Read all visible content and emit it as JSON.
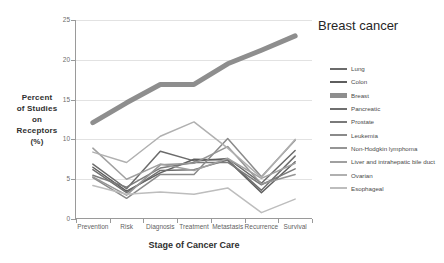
{
  "chart_data": {
    "type": "line",
    "title": "",
    "xlabel": "Stage of Cancer Care",
    "ylabel": "Percent of Studies on Receptors (%)",
    "ylabel_lines": [
      "Percent",
      "of Studies",
      "on",
      "Receptors",
      "(%)"
    ],
    "categories": [
      "Prevention",
      "Risk",
      "Diagnosis",
      "Treatment",
      "Metastasis",
      "Recurrence",
      "Survival"
    ],
    "ylim": [
      0,
      25
    ],
    "yticks": [
      0,
      5,
      10,
      15,
      20,
      25
    ],
    "grid": "horizontal",
    "legend_position": "right",
    "annotations": [
      {
        "text": "Breast cancer",
        "series": "Breast",
        "x": "Survival"
      }
    ],
    "series": [
      {
        "name": "Lung",
        "color": "#6b6b6b",
        "width": 1.5,
        "values": [
          6.9,
          3.8,
          8.5,
          7.3,
          7.6,
          4.5,
          8.6
        ]
      },
      {
        "name": "Colon",
        "color": "#5e5e5e",
        "width": 1.5,
        "values": [
          6.5,
          3.5,
          5.8,
          7.5,
          7.4,
          3.3,
          7.2
        ]
      },
      {
        "name": "Breast",
        "color": "#8e8e8e",
        "width": 5.0,
        "values": [
          12.1,
          14.6,
          16.9,
          16.9,
          19.5,
          21.2,
          23.0
        ]
      },
      {
        "name": "Pancreatic",
        "color": "#6f6f6f",
        "width": 1.5,
        "values": [
          6.2,
          3.3,
          6.1,
          6.2,
          7.4,
          3.6,
          7.9
        ]
      },
      {
        "name": "Prostate",
        "color": "#7a7a7a",
        "width": 1.5,
        "values": [
          5.5,
          4.0,
          6.4,
          7.1,
          7.1,
          4.3,
          6.3
        ]
      },
      {
        "name": "Leukemia",
        "color": "#8a8a8a",
        "width": 1.5,
        "values": [
          5.2,
          2.6,
          5.6,
          5.6,
          10.1,
          5.3,
          9.9
        ]
      },
      {
        "name": "Non-Hodgkin lymphoma",
        "color": "#959595",
        "width": 1.5,
        "values": [
          5.3,
          3.0,
          6.8,
          7.0,
          9.1,
          4.4,
          5.6
        ]
      },
      {
        "name": "Liver and intrahepatic bile duct",
        "color": "#a0a0a0",
        "width": 1.5,
        "values": [
          8.9,
          5.0,
          6.9,
          6.1,
          7.6,
          5.1,
          7.0
        ]
      },
      {
        "name": "Ovarian",
        "color": "#b0b0b0",
        "width": 1.5,
        "values": [
          8.4,
          7.1,
          10.4,
          12.2,
          8.9,
          5.2,
          10.0
        ]
      },
      {
        "name": "Esophageal",
        "color": "#bdbdbd",
        "width": 1.5,
        "values": [
          4.2,
          3.1,
          3.4,
          3.1,
          3.9,
          0.8,
          2.5
        ]
      }
    ]
  }
}
